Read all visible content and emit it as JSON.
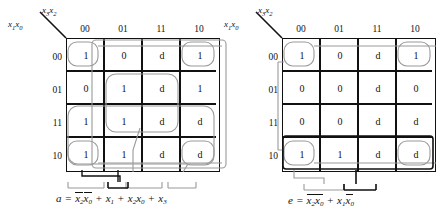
{
  "figure": {
    "type": "karnaugh-map-pair",
    "maps": [
      {
        "id": "map-a",
        "output_name": "a",
        "col_axis_label": "x3x2",
        "row_axis_label": "x1x0",
        "col_headers": [
          "00",
          "01",
          "11",
          "10"
        ],
        "row_headers": [
          "00",
          "01",
          "11",
          "10"
        ],
        "cells": [
          [
            "1",
            "0",
            "d",
            "1"
          ],
          [
            "0",
            "1",
            "d",
            "1"
          ],
          [
            "1",
            "1",
            "d",
            "d"
          ],
          [
            "1",
            "1",
            "d",
            "d"
          ]
        ],
        "equation": {
          "lhs": "a",
          "eq": "=",
          "terms": [
            {
              "text": "x2x0",
              "bars": [
                true,
                true
              ]
            },
            {
              "text": "x1",
              "bars": [
                false
              ]
            },
            {
              "text": "x2x0",
              "bars": [
                false,
                false
              ]
            },
            {
              "text": "x3",
              "bars": [
                false
              ]
            }
          ],
          "plain": "a = x2'x0' + x1 + x2x0 + x3"
        },
        "group_count": 4
      },
      {
        "id": "map-e",
        "output_name": "e",
        "col_axis_label": "x3x2",
        "row_axis_label": "x1x0",
        "col_headers": [
          "00",
          "01",
          "11",
          "10"
        ],
        "row_headers": [
          "00",
          "01",
          "11",
          "10"
        ],
        "cells": [
          [
            "1",
            "0",
            "d",
            "1"
          ],
          [
            "0",
            "0",
            "d",
            "0"
          ],
          [
            "0",
            "0",
            "d",
            "d"
          ],
          [
            "1",
            "1",
            "d",
            "d"
          ]
        ],
        "equation": {
          "lhs": "e",
          "eq": "=",
          "terms": [
            {
              "text": "x2x0",
              "bars": [
                true,
                true
              ]
            },
            {
              "text": "x1x0",
              "bars": [
                false,
                true
              ]
            }
          ],
          "plain": "e = x2'x0' + x1x0'"
        },
        "group_count": 2
      }
    ],
    "colors": {
      "grid": "#111111",
      "group": "#9a9a9a",
      "leader": "#111111",
      "background": "#ffffff"
    }
  }
}
